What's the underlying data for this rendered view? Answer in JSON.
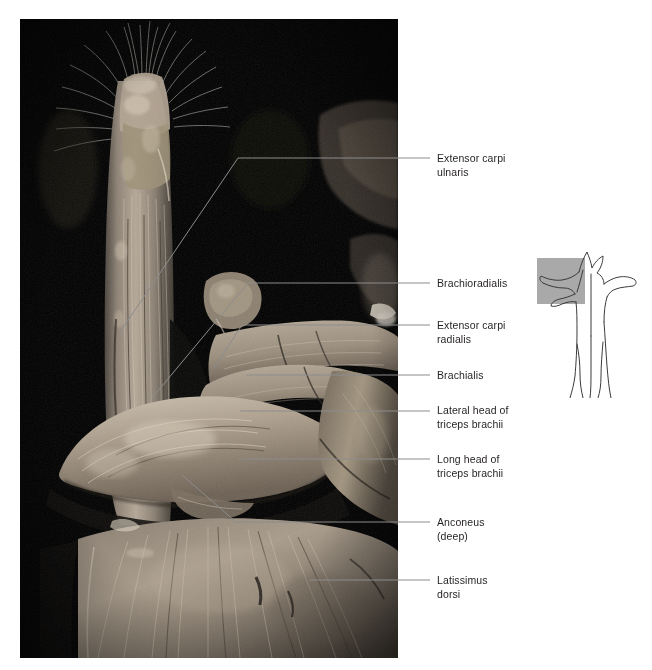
{
  "figure": {
    "kind": "anatomical-photograph-plate",
    "background_color": "#ffffff",
    "plate_background": "#000000",
    "label_color": "#231f20",
    "leader_color": "#8c8c8c"
  },
  "labels": [
    {
      "id": "extensor-carpi-ulnaris",
      "text": "Extensor carpi\nulnaris",
      "y": 152
    },
    {
      "id": "brachioradialis",
      "text": "Brachioradialis",
      "y": 277
    },
    {
      "id": "extensor-carpi-radialis",
      "text": "Extensor carpi\nradialis",
      "y": 319
    },
    {
      "id": "brachialis",
      "text": "Brachialis",
      "y": 369
    },
    {
      "id": "lateral-head-triceps",
      "text": "Lateral head of\ntriceps brachii",
      "y": 404
    },
    {
      "id": "long-head-triceps",
      "text": "Long head of\ntriceps brachii",
      "y": 453
    },
    {
      "id": "anconeus",
      "text": "Anconeus\n(deep)",
      "y": 516
    },
    {
      "id": "latissimus-dorsi",
      "text": "Latissimus\ndorsi",
      "y": 574
    }
  ],
  "orientation_key": {
    "name": "quadruped-orientation-diagram",
    "view": "cranial view of dog, forelimb region highlighted",
    "highlight_color": "#a9a9a9",
    "outline_color": "#3a3a3a"
  }
}
